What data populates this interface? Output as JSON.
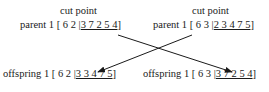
{
  "left": {
    "cut_label": "cut point",
    "parent": {
      "label": "parent 1",
      "head": "[ 6 2 |",
      "tail": "3 7 2 5 4",
      "close": "]"
    },
    "offspring": {
      "label": "offspring 1",
      "head": "[ 6 2 |",
      "tail": "3 3 4 7 5",
      "close": "]"
    }
  },
  "right": {
    "cut_label": "cut point",
    "parent": {
      "label": "parent 1",
      "head": "[ 6 3 |",
      "tail": "2 3 4 7 5",
      "close": "]"
    },
    "offspring": {
      "label": "offspring 1",
      "head": "[ 6 3 |",
      "tail": "3 7 2 5 4",
      "close": "]"
    }
  },
  "colors": {
    "text": "#1a1a1a",
    "arrow": "#1a1a1a"
  }
}
